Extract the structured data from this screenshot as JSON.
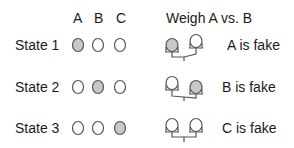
{
  "header": {
    "columns": [
      "A",
      "B",
      "C"
    ],
    "weigh_title": "Weigh A vs. B"
  },
  "states": [
    {
      "label": "State 1",
      "fake": "A",
      "result": "A is fake",
      "scale": "left-heavy"
    },
    {
      "label": "State 2",
      "fake": "B",
      "result": "B is fake",
      "scale": "right-heavy"
    },
    {
      "label": "State 3",
      "fake": "C",
      "result": "C is fake",
      "scale": "balanced"
    }
  ],
  "colors": {
    "filled": "#c8c8c8",
    "stroke": "#555555",
    "empty": "#ffffff"
  }
}
